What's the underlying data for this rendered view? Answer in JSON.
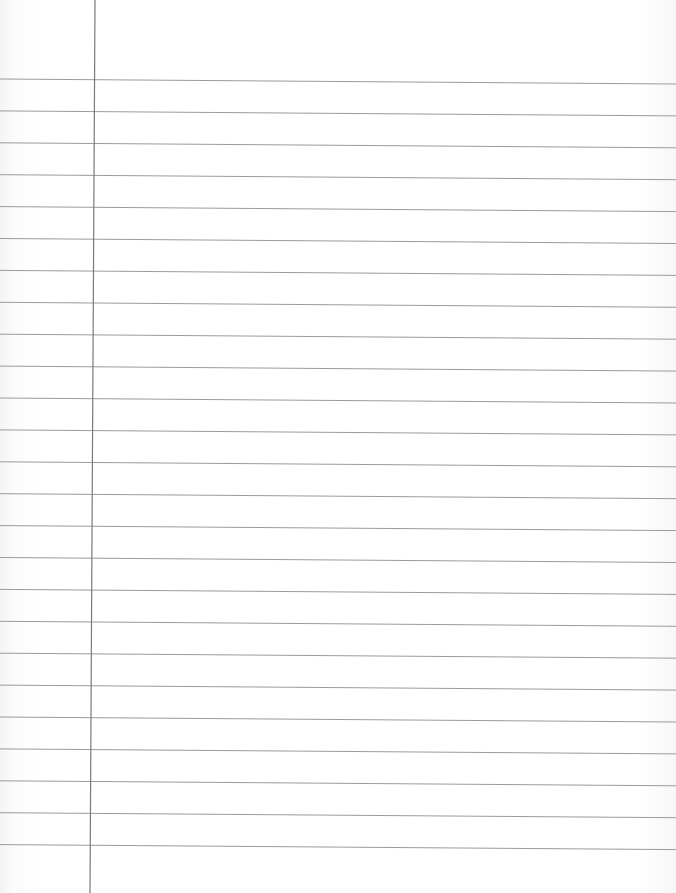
{
  "page": {
    "type": "lined-notebook-paper",
    "background_color": "#ffffff",
    "rule_color": "#8a8a8a",
    "margin_color": "#7a7a7a",
    "rule_count": 25,
    "first_rule_y_left": 79,
    "first_rule_y_right": 84,
    "rule_spacing_px": 31.9,
    "rule_slope_px": 5,
    "margin_line": {
      "x_top": 95,
      "x_bottom": 90
    },
    "text_content": []
  }
}
